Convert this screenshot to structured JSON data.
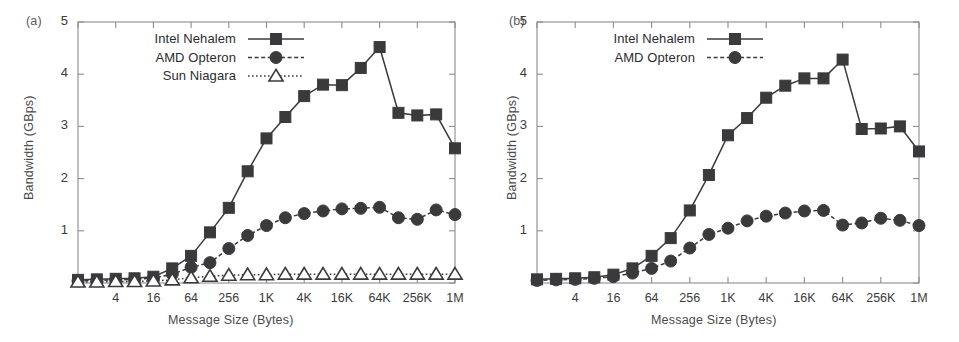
{
  "figure": {
    "background": "#ffffff",
    "ink": "#3a3a3c"
  },
  "panels": [
    {
      "tag": "(a)",
      "ylabel": "Bandwidth (GBps)",
      "xlabel": "Message Size (Bytes)",
      "legend": [
        {
          "label": "Intel Nehalem",
          "marker": "filled-square",
          "linestyle": "solid"
        },
        {
          "label": "AMD Opteron",
          "marker": "filled-circle",
          "linestyle": "dashed"
        },
        {
          "label": "Sun Niagara",
          "marker": "open-triangle",
          "linestyle": "dotted"
        }
      ],
      "ytick_labels": [
        "5",
        "4",
        "3",
        "2",
        "1"
      ],
      "xtick_labels": [
        "4",
        "16",
        "64",
        "256",
        "1K",
        "4K",
        "16K",
        "64K",
        "256K",
        "1M"
      ]
    },
    {
      "tag": "(b)",
      "ylabel": "Bandwidth (GBps)",
      "xlabel": "Message Size (Bytes)",
      "legend": [
        {
          "label": "Intel Nehalem",
          "marker": "filled-square",
          "linestyle": "solid"
        },
        {
          "label": "AMD Opteron",
          "marker": "filled-circle",
          "linestyle": "dashed"
        }
      ],
      "ytick_labels": [
        "5",
        "4",
        "3",
        "2",
        "1"
      ],
      "xtick_labels": [
        "4",
        "16",
        "64",
        "256",
        "1K",
        "4K",
        "16K",
        "64K",
        "256K",
        "1M"
      ]
    }
  ],
  "chart_data": [
    {
      "type": "line",
      "title": "(a)",
      "xlabel": "Message Size (Bytes)",
      "ylabel": "Bandwidth (GBps)",
      "xscale": "log2",
      "grid": false,
      "legend_position": "top-left",
      "ylim": [
        0,
        5
      ],
      "yticks": [
        0,
        1,
        2,
        3,
        4,
        5
      ],
      "ytick_labels": [
        "",
        "1",
        "2",
        "3",
        "4",
        "5"
      ],
      "categories": [
        "1",
        "2",
        "4",
        "8",
        "16",
        "32",
        "64",
        "128",
        "256",
        "512",
        "1K",
        "2K",
        "4K",
        "8K",
        "16K",
        "32K",
        "64K",
        "128K",
        "256K",
        "512K",
        "1M"
      ],
      "xtick_labels": [
        "",
        "",
        "4",
        "",
        "16",
        "",
        "64",
        "",
        "256",
        "",
        "1K",
        "",
        "4K",
        "",
        "16K",
        "",
        "64K",
        "",
        "256K",
        "",
        "1M"
      ],
      "series": [
        {
          "name": "Intel Nehalem",
          "marker": "filled-square",
          "linestyle": "solid",
          "values": [
            0.06,
            0.07,
            0.08,
            0.09,
            0.12,
            0.28,
            0.52,
            0.97,
            1.44,
            2.14,
            2.77,
            3.18,
            3.58,
            3.8,
            3.79,
            4.12,
            4.52,
            3.26,
            3.21,
            3.23,
            2.58
          ]
        },
        {
          "name": "AMD Opteron",
          "marker": "filled-circle",
          "linestyle": "dashed",
          "values": [
            0.04,
            0.05,
            0.06,
            0.07,
            0.09,
            0.17,
            0.3,
            0.39,
            0.66,
            0.91,
            1.1,
            1.25,
            1.33,
            1.38,
            1.42,
            1.43,
            1.45,
            1.25,
            1.22,
            1.4,
            1.31
          ]
        },
        {
          "name": "Sun Niagara",
          "marker": "open-triangle",
          "linestyle": "dotted",
          "values": [
            0.02,
            0.02,
            0.03,
            0.03,
            0.04,
            0.06,
            0.1,
            0.13,
            0.15,
            0.16,
            0.16,
            0.17,
            0.17,
            0.17,
            0.17,
            0.17,
            0.17,
            0.17,
            0.17,
            0.17,
            0.17
          ]
        }
      ]
    },
    {
      "type": "line",
      "title": "(b)",
      "xlabel": "Message Size (Bytes)",
      "ylabel": "Bandwidth (GBps)",
      "xscale": "log2",
      "grid": false,
      "legend_position": "top-left",
      "ylim": [
        0,
        5
      ],
      "yticks": [
        0,
        1,
        2,
        3,
        4,
        5
      ],
      "ytick_labels": [
        "",
        "1",
        "2",
        "3",
        "4",
        "5"
      ],
      "categories": [
        "1",
        "2",
        "4",
        "8",
        "16",
        "32",
        "64",
        "128",
        "256",
        "512",
        "1K",
        "2K",
        "4K",
        "8K",
        "16K",
        "32K",
        "64K",
        "128K",
        "256K",
        "512K",
        "1M"
      ],
      "xtick_labels": [
        "",
        "",
        "4",
        "",
        "16",
        "",
        "64",
        "",
        "256",
        "",
        "1K",
        "",
        "4K",
        "",
        "16K",
        "",
        "64K",
        "",
        "256K",
        "",
        "1M"
      ],
      "series": [
        {
          "name": "Intel Nehalem",
          "marker": "filled-square",
          "linestyle": "solid",
          "values": [
            0.07,
            0.08,
            0.09,
            0.11,
            0.16,
            0.28,
            0.52,
            0.86,
            1.39,
            2.07,
            2.83,
            3.16,
            3.55,
            3.78,
            3.92,
            3.92,
            4.28,
            2.95,
            2.96,
            3.0,
            2.52
          ]
        },
        {
          "name": "AMD Opteron",
          "marker": "filled-circle",
          "linestyle": "dashed",
          "values": [
            0.05,
            0.06,
            0.07,
            0.09,
            0.12,
            0.19,
            0.28,
            0.42,
            0.67,
            0.93,
            1.05,
            1.19,
            1.28,
            1.34,
            1.38,
            1.39,
            1.11,
            1.15,
            1.24,
            1.2,
            1.1
          ]
        }
      ]
    }
  ]
}
